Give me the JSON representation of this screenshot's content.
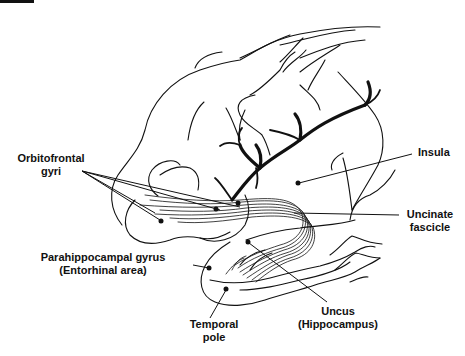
{
  "figure": {
    "type": "anatomical-diagram",
    "line_color": "#111111",
    "background": "#ffffff"
  },
  "labels": {
    "orbitofrontal": {
      "line1": "Orbitofrontal",
      "line2": "gyri"
    },
    "insula": {
      "line1": "Insula"
    },
    "uncinate": {
      "line1": "Uncinate",
      "line2": "fascicle"
    },
    "parahippocampal": {
      "line1": "Parahippocampal gyrus",
      "line2": "(Entorhinal area)"
    },
    "temporal_pole": {
      "line1": "Temporal",
      "line2": "pole"
    },
    "uncus": {
      "line1": "Uncus",
      "line2": "(Hippocampus)"
    }
  }
}
